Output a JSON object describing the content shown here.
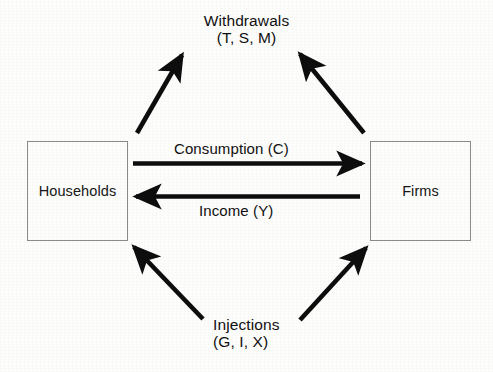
{
  "diagram": {
    "type": "circular-flow-of-income",
    "nodes": [
      {
        "id": "households",
        "label": "Households"
      },
      {
        "id": "firms",
        "label": "Firms"
      }
    ],
    "poles": {
      "withdrawals": {
        "title": "Withdrawals",
        "detail": "(T, S, M)"
      },
      "injections": {
        "title": "Injections",
        "detail": "(G, I, X)"
      }
    },
    "flows": [
      {
        "id": "consumption",
        "label": "Consumption (C)",
        "from": "households",
        "to": "firms",
        "direction": "right"
      },
      {
        "id": "income",
        "label": "Income (Y)",
        "from": "firms",
        "to": "households",
        "direction": "left"
      },
      {
        "id": "withdrawal-households",
        "from": "households",
        "to": "withdrawals",
        "direction": "up-right"
      },
      {
        "id": "withdrawal-firms",
        "from": "firms",
        "to": "withdrawals",
        "direction": "up-left"
      },
      {
        "id": "injection-households",
        "from": "injections",
        "to": "households",
        "direction": "up-left"
      },
      {
        "id": "injection-firms",
        "from": "injections",
        "to": "firms",
        "direction": "up-right"
      }
    ],
    "colors": {
      "arrow": "#0d0d0d",
      "box_border": "#8a8a8a",
      "text": "#101010",
      "background": "#fdfdfc"
    }
  }
}
